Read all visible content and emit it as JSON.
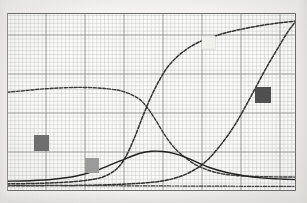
{
  "figure": {
    "name": "scanned-line-chart",
    "background_color": "#f2f1ef",
    "paper_color": "#fbfbfa",
    "frame_color": "#6b6b6b"
  },
  "grid": {
    "minor_color": "#c9c9c6",
    "major_color": "#8d8d8a",
    "minor_step_px": 3.9,
    "major_every": 10,
    "grid_on": true
  },
  "markers": [
    {
      "name": "marker-dark-left",
      "label": "",
      "color": "#6e6e6e",
      "x": 34,
      "y": 135,
      "w": 15,
      "h": 16
    },
    {
      "name": "marker-mid-lower",
      "label": "",
      "color": "#9b9b9b",
      "x": 85,
      "y": 158,
      "w": 14,
      "h": 15
    },
    {
      "name": "marker-light-top",
      "label": "",
      "color": "#efefec",
      "x": 202,
      "y": 36,
      "w": 13,
      "h": 13
    },
    {
      "name": "marker-dark-right",
      "label": "",
      "color": "#4f4f4f",
      "x": 255,
      "y": 87,
      "w": 16,
      "h": 16
    }
  ],
  "chart_data": {
    "type": "line",
    "title": "",
    "subtitle": "",
    "xlabel": "",
    "ylabel": "",
    "xlim": [
      0,
      100
    ],
    "ylim": [
      0,
      100
    ],
    "grid": true,
    "legend_position": "none",
    "xticks": [
      0,
      12.5,
      25,
      37.5,
      50,
      62.5,
      75,
      87.5,
      100
    ],
    "xticklabels": [
      "",
      "",
      "",
      "",
      "",
      "",
      "",
      "",
      ""
    ],
    "yticks": [
      0,
      12.5,
      25,
      37.5,
      50,
      62.5,
      75,
      87.5,
      100
    ],
    "yticklabels": [
      "",
      "",
      "",
      "",
      "",
      "",
      "",
      "",
      ""
    ],
    "series": [
      {
        "name": "curve-a-early-sigmoid",
        "style": "dashed",
        "color": "#3a3a3a",
        "width": 1.4,
        "points": [
          [
            0,
            55.5
          ],
          [
            5,
            56.2
          ],
          [
            10,
            57.0
          ],
          [
            15,
            57.6
          ],
          [
            20,
            58.0
          ],
          [
            25,
            58.2
          ],
          [
            30,
            58.0
          ],
          [
            35,
            57.4
          ],
          [
            40,
            56.0
          ],
          [
            45,
            52.5
          ],
          [
            48,
            48.0
          ],
          [
            51,
            41.0
          ],
          [
            54,
            33.0
          ],
          [
            57,
            26.0
          ],
          [
            60,
            21.0
          ],
          [
            65,
            15.0
          ],
          [
            70,
            11.5
          ],
          [
            75,
            9.5
          ],
          [
            80,
            8.6
          ],
          [
            85,
            8.2
          ],
          [
            90,
            8.0
          ],
          [
            95,
            7.9
          ],
          [
            100,
            7.8
          ]
        ]
      },
      {
        "name": "curve-b-mid-sigmoid-rise",
        "style": "dashed",
        "color": "#2e2e2e",
        "width": 1.5,
        "points": [
          [
            0,
            4.0
          ],
          [
            8,
            4.2
          ],
          [
            16,
            4.6
          ],
          [
            24,
            5.4
          ],
          [
            30,
            6.6
          ],
          [
            34,
            8.4
          ],
          [
            38,
            12.5
          ],
          [
            41,
            19.0
          ],
          [
            44,
            29.5
          ],
          [
            47,
            42.0
          ],
          [
            50,
            53.5
          ],
          [
            53,
            63.0
          ],
          [
            56,
            70.5
          ],
          [
            60,
            77.0
          ],
          [
            65,
            82.5
          ],
          [
            70,
            86.0
          ],
          [
            76,
            89.0
          ],
          [
            82,
            91.2
          ],
          [
            88,
            93.0
          ],
          [
            94,
            94.4
          ],
          [
            100,
            95.5
          ]
        ]
      },
      {
        "name": "curve-c-late-sigmoid-rise",
        "style": "dashed",
        "color": "#2e2e2e",
        "width": 1.5,
        "points": [
          [
            0,
            3.0
          ],
          [
            10,
            3.0
          ],
          [
            20,
            3.1
          ],
          [
            30,
            3.3
          ],
          [
            40,
            3.8
          ],
          [
            48,
            4.6
          ],
          [
            55,
            6.0
          ],
          [
            62,
            9.5
          ],
          [
            68,
            15.5
          ],
          [
            73,
            24.0
          ],
          [
            78,
            35.0
          ],
          [
            82,
            46.0
          ],
          [
            86,
            58.0
          ],
          [
            90,
            70.0
          ],
          [
            94,
            81.0
          ],
          [
            97,
            89.0
          ],
          [
            100,
            95.5
          ]
        ]
      },
      {
        "name": "curve-d-low-hump",
        "style": "solid",
        "color": "#1f1f1f",
        "width": 1.4,
        "points": [
          [
            0,
            5.5
          ],
          [
            8,
            5.8
          ],
          [
            16,
            6.6
          ],
          [
            24,
            8.4
          ],
          [
            30,
            11.0
          ],
          [
            36,
            14.8
          ],
          [
            42,
            18.8
          ],
          [
            46,
            21.2
          ],
          [
            50,
            22.3
          ],
          [
            54,
            22.2
          ],
          [
            58,
            21.0
          ],
          [
            62,
            18.8
          ],
          [
            66,
            16.0
          ],
          [
            70,
            13.2
          ],
          [
            76,
            10.4
          ],
          [
            82,
            8.6
          ],
          [
            88,
            7.4
          ],
          [
            94,
            6.8
          ],
          [
            100,
            6.4
          ]
        ]
      },
      {
        "name": "curve-e-flat-baseline",
        "style": "dash-dot",
        "color": "#3d3d3d",
        "width": 1.2,
        "points": [
          [
            0,
            3.2
          ],
          [
            15,
            3.1
          ],
          [
            30,
            3.0
          ],
          [
            45,
            2.9
          ],
          [
            60,
            2.8
          ],
          [
            75,
            2.7
          ],
          [
            90,
            2.6
          ],
          [
            100,
            2.6
          ]
        ]
      }
    ]
  }
}
